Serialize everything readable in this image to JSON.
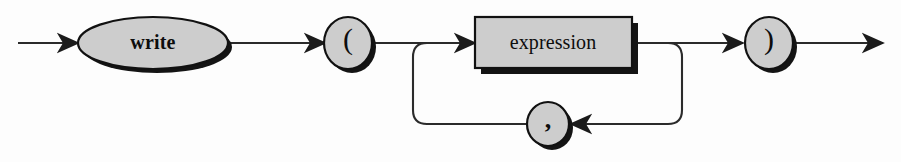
{
  "diagram": {
    "type": "railroad-syntax-diagram",
    "canvas": {
      "width": 901,
      "height": 162
    },
    "palette": {
      "background": "#fdfdfd",
      "node_fill": "#cdcdcd",
      "node_stroke": "#111111",
      "shadow": "#141414",
      "line": "#2b2b2b",
      "text": "#0d0d0d"
    },
    "nodes": [
      {
        "id": "write",
        "shape": "ellipse",
        "label": "write",
        "role": "terminal-keyword",
        "cx": 153,
        "cy": 43,
        "rx": 75,
        "ry": 26
      },
      {
        "id": "lparen",
        "shape": "circle",
        "label": "(",
        "role": "terminal-symbol",
        "cx": 348,
        "cy": 43,
        "rx": 24,
        "ry": 26
      },
      {
        "id": "expression",
        "shape": "rect",
        "label": "expression",
        "role": "nonterminal",
        "x": 475,
        "y": 17,
        "width": 157,
        "height": 51
      },
      {
        "id": "rparen",
        "shape": "circle",
        "label": ")",
        "role": "terminal-symbol",
        "cx": 769,
        "cy": 43,
        "rx": 24,
        "ry": 26
      },
      {
        "id": "comma",
        "shape": "circle",
        "label": ",",
        "role": "terminal-separator",
        "cx": 548,
        "cy": 124,
        "rx": 21,
        "ry": 22
      }
    ],
    "paths": {
      "main_line_y": 43,
      "loop_line_y": 124,
      "loop_left_x": 413,
      "loop_right_x": 682,
      "entry_x": 18,
      "exit_x": 883
    },
    "arrows": [
      {
        "id": "entry-arrow",
        "x": 78,
        "y": 43,
        "direction": "right"
      },
      {
        "id": "to-lparen-arrow",
        "x": 325,
        "y": 43,
        "direction": "right"
      },
      {
        "id": "to-expression-arrow",
        "x": 475,
        "y": 43,
        "direction": "right"
      },
      {
        "id": "to-rparen-arrow",
        "x": 743,
        "y": 43,
        "direction": "right"
      },
      {
        "id": "exit-arrow",
        "x": 883,
        "y": 43,
        "direction": "right"
      },
      {
        "id": "to-comma-arrow",
        "x": 571,
        "y": 124,
        "direction": "left"
      }
    ],
    "reading": "write ( expression { , expression } )"
  }
}
